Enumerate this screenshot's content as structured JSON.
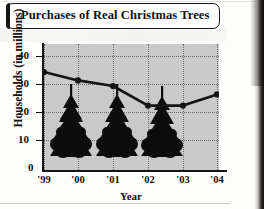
{
  "figure": {
    "title": "Purchases of Real Christmas Trees",
    "decoration_icon": "christmas-tree-icon"
  },
  "chart_data": {
    "type": "line",
    "title": "Purchases of Real Christmas Trees",
    "xlabel": "Year",
    "ylabel": "Households (in millions)",
    "categories": [
      "'99",
      "'00",
      "'01",
      "'02",
      "'03",
      "'04"
    ],
    "values": [
      35,
      32,
      30,
      23,
      23,
      27
    ],
    "series": [
      {
        "name": "Households purchasing real Christmas trees",
        "values": [
          35,
          32,
          30,
          23,
          23,
          27
        ]
      }
    ],
    "ylim": [
      0,
      45
    ],
    "yticks": [
      0,
      10,
      20,
      30,
      40
    ],
    "ytick_labels": [
      "0",
      "10",
      "20",
      "30",
      "40"
    ],
    "xtick_labels": [
      "'99",
      "'00",
      "'01",
      "'02",
      "'03",
      "'04"
    ],
    "grid": true,
    "grid_style": "dotted",
    "legend": null,
    "legend_position": "none",
    "plot_background": "#c9c9c9",
    "line_color": "#141414",
    "marker": "circle",
    "marker_color": "#141414"
  }
}
